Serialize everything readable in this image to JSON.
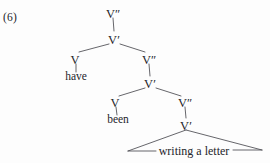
{
  "figure": {
    "example_number": "(6)",
    "type": "syntax-tree",
    "width": 270,
    "height": 163,
    "background_color": "#fdfdfd",
    "line_color": "#4a4a50",
    "text_color": "#25252a"
  },
  "nodes": [
    {
      "id": "vbar2_top",
      "label": "V″",
      "x": 113,
      "y": 14,
      "kind": "nonterminal"
    },
    {
      "id": "vbar_top",
      "label": "V′",
      "x": 114,
      "y": 40,
      "kind": "nonterminal"
    },
    {
      "id": "v_have",
      "label": "V",
      "x": 75,
      "y": 60,
      "kind": "nonterminal"
    },
    {
      "id": "vbar2_mid",
      "label": "V″",
      "x": 149,
      "y": 60,
      "kind": "nonterminal"
    },
    {
      "id": "vbar_mid",
      "label": "V′",
      "x": 150,
      "y": 84,
      "kind": "nonterminal"
    },
    {
      "id": "v_been",
      "label": "V",
      "x": 115,
      "y": 103,
      "kind": "nonterminal"
    },
    {
      "id": "vbar2_low",
      "label": "V″",
      "x": 185,
      "y": 103,
      "kind": "nonterminal"
    },
    {
      "id": "vbar_low",
      "label": "V′",
      "x": 186,
      "y": 126,
      "kind": "nonterminal"
    }
  ],
  "terminals": [
    {
      "id": "have",
      "label": "have",
      "x": 76,
      "y": 80
    },
    {
      "id": "been",
      "label": "been",
      "x": 118,
      "y": 123
    },
    {
      "id": "phrase",
      "label": "writing a letter",
      "x": 194,
      "y": 152
    }
  ],
  "branches": [
    {
      "from": "vbar2_top",
      "to": "vbar_top",
      "x1": 113,
      "y1": 18,
      "x2": 114,
      "y2": 31
    },
    {
      "from": "vbar_top",
      "to": "v_have",
      "x1": 109,
      "y1": 44,
      "x2": 79,
      "y2": 52
    },
    {
      "from": "vbar_top",
      "to": "vbar2_mid",
      "x1": 120,
      "y1": 44,
      "x2": 145,
      "y2": 52
    },
    {
      "from": "v_have",
      "to": "have",
      "x1": 76,
      "y1": 64,
      "x2": 76,
      "y2": 72
    },
    {
      "from": "vbar2_mid",
      "to": "vbar_mid",
      "x1": 149,
      "y1": 64,
      "x2": 150,
      "y2": 76
    },
    {
      "from": "vbar_mid",
      "to": "v_been",
      "x1": 145,
      "y1": 88,
      "x2": 119,
      "y2": 96
    },
    {
      "from": "vbar_mid",
      "to": "vbar2_low",
      "x1": 156,
      "y1": 88,
      "x2": 181,
      "y2": 96
    },
    {
      "from": "v_been",
      "to": "been",
      "x1": 116,
      "y1": 107,
      "x2": 117,
      "y2": 115
    },
    {
      "from": "vbar2_low",
      "to": "vbar_low",
      "x1": 185,
      "y1": 107,
      "x2": 186,
      "y2": 118
    }
  ],
  "triangle": {
    "apex_x": 186,
    "apex_y": 130,
    "left_x": 128,
    "left_y": 151,
    "right_x": 262,
    "right_y": 150,
    "label": "writing a letter"
  }
}
